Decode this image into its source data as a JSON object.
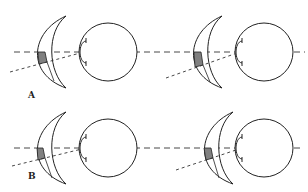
{
  "figure": {
    "labels": {
      "row_a": "A",
      "row_b": "B"
    },
    "colors": {
      "stroke": "#222222",
      "prism_fill": "#808080",
      "background": "#ffffff"
    },
    "panels": [
      {
        "id": "A-left",
        "row": "A",
        "lens_x": 36,
        "eye_cx": 102,
        "y": 52
      },
      {
        "id": "A-right",
        "row": "A",
        "lens_x": 192,
        "eye_cx": 255,
        "y": 52
      },
      {
        "id": "B-left",
        "row": "B",
        "lens_x": 36,
        "eye_cx": 102,
        "y": 148
      },
      {
        "id": "B-right",
        "row": "B",
        "lens_x": 203,
        "eye_cx": 255,
        "y": 148
      }
    ]
  }
}
